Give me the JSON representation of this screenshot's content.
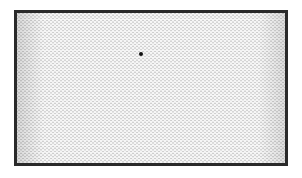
{
  "image": {
    "description": "Hexagonal close-packed lattice of bright round particles (bubble-raft / colloidal crystal) inside a dark rectangular frame",
    "colors": {
      "background": "#ffffff",
      "frame": "#2a2a2a",
      "particle": "#f6f6f6",
      "gaps": "#6f6f6f",
      "defect": "#111111"
    },
    "frame": {
      "x": 14,
      "y": 10,
      "width": 274,
      "height": 156
    },
    "lattice": {
      "type": "hexagonal",
      "spacing_px": 4
    },
    "defects": [
      {
        "x": 139,
        "y": 52,
        "type": "vacancy"
      }
    ],
    "caption": "Hexagonal particle lattice with a single point defect"
  }
}
